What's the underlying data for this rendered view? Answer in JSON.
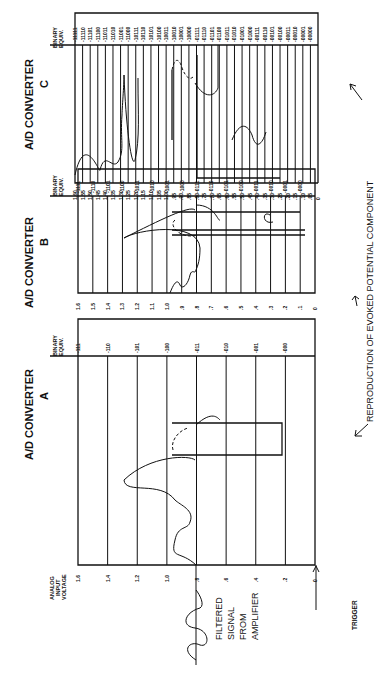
{
  "converters": {
    "c": {
      "title": "A/D CONVERTER",
      "letter": "C",
      "binary_header_1": "BINARY",
      "binary_header_2": "EQUIV.",
      "voltage_ticks": [
        "1.60",
        "1.55",
        "1.50",
        "1.45",
        "1.40",
        "1.35",
        "1.30",
        "1.25",
        "1.20",
        "1.15",
        "1.10",
        "1.05",
        "1.00",
        ".95",
        ".90",
        ".85",
        ".80",
        ".75",
        ".70",
        ".65",
        ".60",
        ".55",
        ".50",
        ".45",
        ".40",
        ".35",
        ".30",
        ".25",
        ".20",
        ".15",
        ".10",
        ".05",
        "0"
      ],
      "binary_codes": [
        "11111",
        "11110",
        "11101",
        "11100",
        "11011",
        "11010",
        "11001",
        "11000",
        "10111",
        "10110",
        "10101",
        "10100",
        "10011",
        "10010",
        "10001",
        "10000",
        "01111",
        "01110",
        "01101",
        "01100",
        "01011",
        "01010",
        "01001",
        "01000",
        "00111",
        "00110",
        "00101",
        "00100",
        "00011",
        "00010",
        "00001",
        "00000"
      ]
    },
    "b": {
      "title": "A/D CONVERTER",
      "letter": "B",
      "binary_header_1": "BINARY",
      "binary_header_2": "EQUIV.",
      "voltage_ticks": [
        "1.6",
        "1.5",
        "1.4",
        "1.3",
        "1.2",
        "1.1",
        "1.0",
        ".9",
        ".8",
        ".7",
        ".6",
        ".5",
        ".4",
        ".3",
        ".2",
        ".1",
        "0"
      ],
      "binary_codes": [
        "1111",
        "1110",
        "1101",
        "1100",
        "1011",
        "1010",
        "1001",
        "1000",
        "0111",
        "0110",
        "0101",
        "0100",
        "0011",
        "0010",
        "0001",
        "0000"
      ]
    },
    "a": {
      "title": "A/D CONVERTER",
      "letter": "A",
      "axis_label_1": "ANALOG",
      "axis_label_2": "INPUT",
      "axis_label_3": "VOLTAGE",
      "binary_header_1": "BINARY",
      "binary_header_2": "EQUIV.",
      "voltage_ticks": [
        "1.6",
        "1.4",
        "1.2",
        "1.0",
        ".8",
        ".6",
        ".4",
        ".2",
        "0"
      ],
      "binary_codes": [
        "111",
        "110",
        "101",
        "100",
        "011",
        "010",
        "001",
        "000"
      ]
    }
  },
  "labels": {
    "filtered_1": "FILTERED",
    "filtered_2": "SIGNAL",
    "filtered_3": "FROM",
    "filtered_4": "AMPLIFIER",
    "trigger": "TRIGGER",
    "reproduction": "REPRODUCTION OF EVOKED POTENTIAL COMPONENT"
  }
}
